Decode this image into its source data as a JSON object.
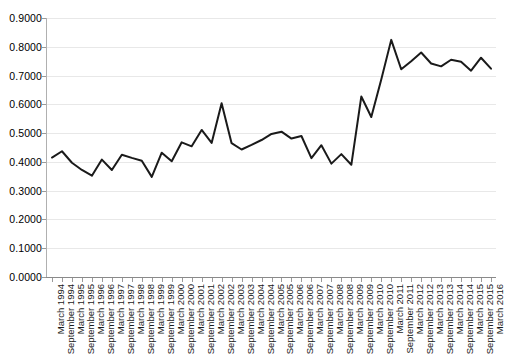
{
  "chart_data": {
    "type": "line",
    "title": "",
    "subtitle": "",
    "xlabel": "",
    "ylabel": "",
    "ylim": [
      0.0,
      0.9
    ],
    "ytick_labels": [
      "0.9000",
      "0.8000",
      "0.7000",
      "0.6000",
      "0.5000",
      "0.4000",
      "0.3000",
      "0.2000",
      "0.1000",
      "0.0000"
    ],
    "ytick_values": [
      0.9,
      0.8,
      0.7,
      0.6,
      0.5,
      0.4,
      0.3,
      0.2,
      0.1,
      0.0
    ],
    "grid": true,
    "legend": "none",
    "line_color": "#1a1a1a",
    "categories": [
      "March 1994",
      "September 1994",
      "March 1995",
      "September 1995",
      "March 1996",
      "September 1996",
      "March 1997",
      "September 1997",
      "March 1998",
      "September 1998",
      "March 1999",
      "September 1999",
      "March 2000",
      "September 2000",
      "March 2001",
      "September 2001",
      "March 2002",
      "September 2002",
      "March 2003",
      "September 2003",
      "March 2004",
      "September 2004",
      "March 2005",
      "September 2005",
      "March 2006",
      "September 2006",
      "March 2007",
      "September 2007",
      "March 2008",
      "September 2008",
      "March 2009",
      "September 2009",
      "March 2010",
      "September 2010",
      "March 2011",
      "September 2011",
      "March 2012",
      "September 2012",
      "March 2013",
      "September 2013",
      "March 2014",
      "September 2014",
      "March 2015",
      "September 2015",
      "March 2016"
    ],
    "values": [
      0.415,
      0.437,
      0.397,
      0.372,
      0.352,
      0.408,
      0.372,
      0.425,
      0.414,
      0.404,
      0.348,
      0.432,
      0.402,
      0.468,
      0.454,
      0.511,
      0.466,
      0.604,
      0.465,
      0.443,
      0.459,
      0.476,
      0.497,
      0.505,
      0.481,
      0.49,
      0.413,
      0.458,
      0.394,
      0.427,
      0.39,
      0.627,
      0.556,
      0.686,
      0.824,
      0.722,
      0.75,
      0.78,
      0.742,
      0.732,
      0.755,
      0.748,
      0.717,
      0.762,
      0.724
    ],
    "annotations": []
  }
}
